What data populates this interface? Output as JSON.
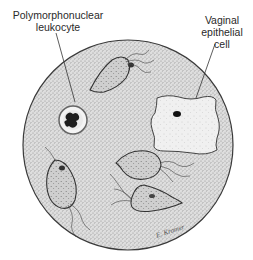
{
  "figure": {
    "type": "microscope-field-illustration",
    "labels": {
      "pmn_line1": "Polymorphonuclear",
      "pmn_line2": "leukocyte",
      "vag_line1": "Vaginal",
      "vag_line2": "epithelial",
      "vag_line3": "cell"
    },
    "signature": "E. Kramer",
    "colors": {
      "field": "#d9d9d9",
      "outline": "#3a3a3a",
      "cell_fill": "#c8c8c8",
      "epithelial_fill": "#eeeeee",
      "nucleus": "#222222"
    },
    "elements": [
      "microscope field circle",
      "polymorphonuclear leukocyte",
      "vaginal epithelial cell",
      "trichomonad 1 (top)",
      "trichomonad 2 (middle right)",
      "trichomonad 3 (lower left)",
      "trichomonad 4 (lower right)"
    ]
  }
}
